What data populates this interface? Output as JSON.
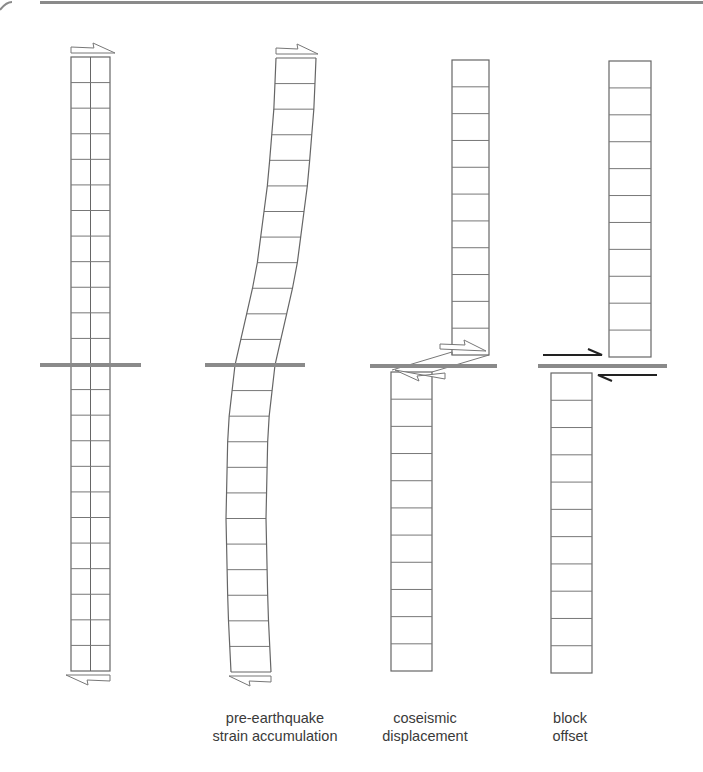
{
  "diagram": {
    "colors": {
      "outline": "#777777",
      "fault": "#8a8a8a",
      "arrow_dark": "#222222",
      "text": "#3a3a3a",
      "border": "#8a8a8a"
    },
    "panels": [
      {
        "id": "initial",
        "label_line1": "",
        "label_line2": ""
      },
      {
        "id": "strain",
        "label_line1": "pre-earthquake",
        "label_line2": "strain accumulation"
      },
      {
        "id": "coseismic",
        "label_line1": "coseismic",
        "label_line2": "displacement"
      },
      {
        "id": "offset",
        "label_line1": "block",
        "label_line2": "offset"
      }
    ]
  }
}
